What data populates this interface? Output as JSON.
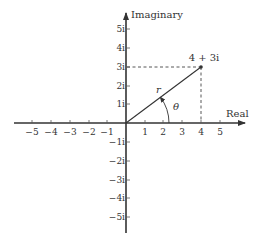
{
  "diagram": {
    "axes": {
      "horizontal_label": "Real",
      "vertical_label": "Imaginary"
    },
    "real_ticks": [
      "−5",
      "−4",
      "−3",
      "−2",
      "−1",
      "1",
      "2",
      "3",
      "4",
      "5"
    ],
    "imag_ticks": [
      "5i",
      "4i",
      "3i",
      "2i",
      "1i",
      "−1i",
      "−2i",
      "−3i",
      "−4i",
      "−5i"
    ],
    "point": {
      "label": "4 + 3i",
      "real": 4,
      "imag": 3
    },
    "vector_label": "r",
    "angle_label": "θ",
    "colors": {
      "line": "#333333",
      "background": "#ffffff"
    }
  }
}
